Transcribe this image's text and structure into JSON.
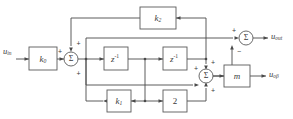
{
  "diagram": {
    "background_color": "#ffffff",
    "line_color": "#4a4a4a",
    "box_fill": "#ffffff",
    "box_stroke": "#5a5a5a"
  },
  "io": {
    "input": {
      "base": "u",
      "sub": "in"
    },
    "output_top": {
      "base": "u",
      "sub": "out"
    },
    "output_bottom": {
      "base": "u",
      "sub": "oβ"
    }
  },
  "blocks": {
    "gain_k0": {
      "base": "k",
      "sub": "0"
    },
    "gain_k2": {
      "base": "k",
      "sub": "2"
    },
    "gain_k1": {
      "base": "k",
      "sub": "1"
    },
    "delay_1": {
      "base": "z",
      "sup": "-1"
    },
    "delay_2": {
      "base": "z",
      "sup": "-1"
    },
    "gain_2": {
      "label": "2"
    },
    "gain_m": {
      "label": "m"
    }
  },
  "summers": {
    "sum_input": {
      "symbol": "Σ",
      "sign_top": "+",
      "sign_left": "+",
      "sign_bottom": "+"
    },
    "sum_output_top": {
      "symbol": "Σ",
      "sign_left": "+",
      "sign_bottom": "−"
    },
    "sum_output_bottom": {
      "symbol": "Σ",
      "sign_top": "+",
      "sign_left": "+",
      "sign_bottom": "+"
    }
  }
}
